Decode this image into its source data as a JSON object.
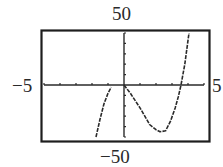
{
  "chart_data": {
    "type": "line",
    "title": "",
    "xlabel": "",
    "ylabel": "",
    "window": {
      "xmin_label": "-5",
      "xmax_label": "5",
      "ymin_label": "-50",
      "ymax_label": "50"
    },
    "xlim": [
      -5,
      5
    ],
    "ylim": [
      -50,
      50
    ],
    "x_tick_step": 1,
    "y_tick_step": 10,
    "grid": false,
    "legend": null,
    "series": [
      {
        "name": "left-branch",
        "points": [
          [
            -1.75,
            -50
          ],
          [
            -1.5,
            -33
          ],
          [
            -1.25,
            -18
          ],
          [
            -1.0,
            -8
          ],
          [
            -0.8,
            -2
          ]
        ]
      },
      {
        "name": "main-branch",
        "points": [
          [
            0,
            0
          ],
          [
            0.4,
            -8
          ],
          [
            1.0,
            -22
          ],
          [
            1.6,
            -38
          ],
          [
            2.0,
            -43
          ],
          [
            2.25,
            -45
          ],
          [
            2.6,
            -44
          ],
          [
            2.9,
            -35
          ],
          [
            3.2,
            -22
          ],
          [
            3.4,
            -11
          ],
          [
            3.56,
            0
          ],
          [
            3.8,
            20
          ],
          [
            4.06,
            50
          ]
        ]
      }
    ]
  },
  "labels": {
    "top": "50",
    "bottom": "−50",
    "left": "−5",
    "right": "5"
  },
  "colors": {
    "frame": "#1e1e1e",
    "axis": "#2a2a2a",
    "curve": "#2a2a2a",
    "background": "#ffffff"
  }
}
